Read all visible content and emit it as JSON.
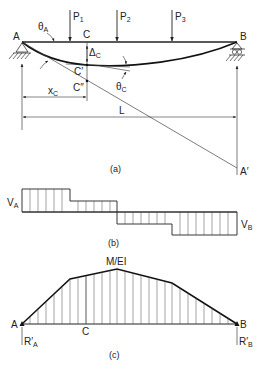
{
  "figure": {
    "panel_a": {
      "caption": "(a)",
      "support_left_label": "A",
      "support_right_label": "B",
      "loads": [
        {
          "label": "P",
          "sub": "1"
        },
        {
          "label": "P",
          "sub": "2"
        },
        {
          "label": "P",
          "sub": "3"
        }
      ],
      "theta_a": {
        "label": "θ",
        "sub": "A"
      },
      "point_c": "C",
      "point_c_prime": "C′",
      "point_c_double_prime": "C″",
      "delta_c": {
        "label": "Δ",
        "sub": "C"
      },
      "theta_c": {
        "label": "θ",
        "sub": "C"
      },
      "x_c": {
        "label": "x",
        "sub": "C"
      },
      "span": "L",
      "tangent_end": "A′"
    },
    "panel_b": {
      "caption": "(b)",
      "left_value": {
        "label": "V",
        "sub": "A"
      },
      "right_value": {
        "label": "V",
        "sub": "B"
      }
    },
    "panel_c": {
      "caption": "(c)",
      "peak_label": "M/EI",
      "left_label": "A",
      "right_label": "B",
      "mid_label": "C",
      "reaction_left": {
        "label": "R′",
        "sub": "A"
      },
      "reaction_right": {
        "label": "R′",
        "sub": "B"
      }
    }
  }
}
